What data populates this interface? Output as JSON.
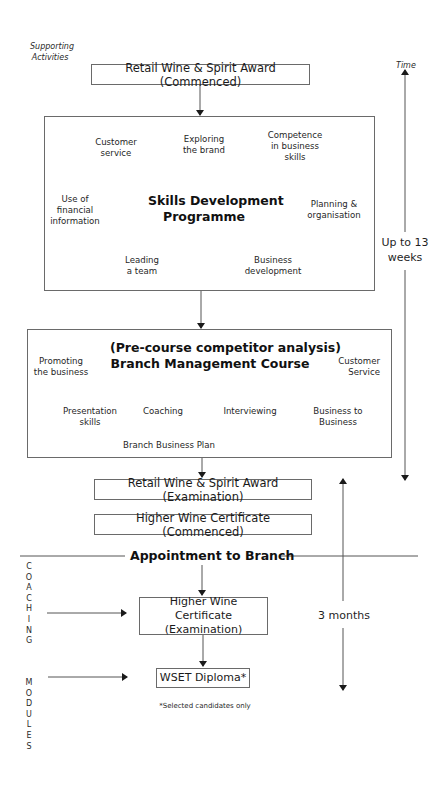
{
  "header": {
    "supporting_activities": "Supporting\nActivities",
    "supporting_line1": "Supporting",
    "supporting_line2": "Activities",
    "time_label": "Time"
  },
  "boxes": {
    "rwsa_commenced": "Retail Wine & Spirit Award (Commenced)",
    "rwsa_examination": "Retail Wine & Spirit Award (Examination)",
    "hwc_commenced": "Higher Wine Certificate (Commenced)",
    "hwc_examination_line1": "Higher Wine Certificate",
    "hwc_examination_line2": "(Examination)",
    "wset_diploma": "WSET Diploma*"
  },
  "skills_programme": {
    "title_line1": "Skills Development",
    "title_line2": "Programme",
    "spokes": [
      {
        "line1": "Customer",
        "line2": "service"
      },
      {
        "line1": "Exploring",
        "line2": "the brand"
      },
      {
        "line1": "Competence",
        "line2": "in business",
        "line3": "skills"
      },
      {
        "line1": "Use of",
        "line2": "financial",
        "line3": "information"
      },
      {
        "line1": "Planning &",
        "line2": "organisation"
      },
      {
        "line1": "Leading",
        "line2": "a team"
      },
      {
        "line1": "Business",
        "line2": "development"
      }
    ]
  },
  "branch_course": {
    "title_line1": "(Pre-course competitor analysis)",
    "title_line2": "Branch Management Course",
    "spokes": [
      {
        "line1": "Promoting",
        "line2": "the business"
      },
      {
        "line1": "Customer",
        "line2": "Service"
      },
      {
        "line1": "Presentation",
        "line2": "skills"
      },
      {
        "line1": "Coaching"
      },
      {
        "line1": "Interviewing"
      },
      {
        "line1": "Business to",
        "line2": "Business"
      },
      {
        "line1": "Branch Business Plan"
      }
    ]
  },
  "milestone": {
    "appointment": "Appointment to Branch"
  },
  "timeline": {
    "phase1_line1": "Up to 13",
    "phase1_line2": "weeks",
    "phase2": "3 months"
  },
  "side_activities": {
    "coaching": [
      "C",
      "O",
      "A",
      "C",
      "H",
      "I",
      "N",
      "G"
    ],
    "modules": [
      "M",
      "O",
      "D",
      "U",
      "L",
      "E",
      "S"
    ]
  },
  "footnote": "*Selected candidates only",
  "colors": {
    "line": "#555555",
    "border": "#6a6a6a",
    "text": "#1a1a1a",
    "background": "#ffffff"
  }
}
